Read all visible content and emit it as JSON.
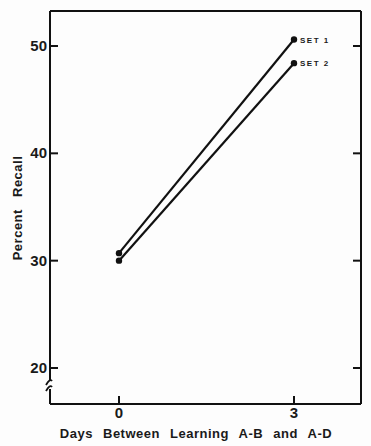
{
  "chart_data": {
    "type": "line",
    "title": "",
    "xlabel": "Days Between Learning A-B and A-D",
    "ylabel": "Percent Recall",
    "x": [
      0,
      3
    ],
    "x_tick_labels": [
      "0",
      "3"
    ],
    "y_ticks": [
      20,
      30,
      40,
      50
    ],
    "y_tick_labels": [
      "20",
      "30",
      "40",
      "50"
    ],
    "ylim": [
      18.5,
      53.5
    ],
    "y_axis_break": true,
    "grid": false,
    "legend_position": "inline at line ends",
    "series": [
      {
        "name": "SET 1",
        "values": [
          30.7,
          50.6
        ]
      },
      {
        "name": "SET 2",
        "values": [
          30.0,
          48.4
        ]
      }
    ]
  }
}
